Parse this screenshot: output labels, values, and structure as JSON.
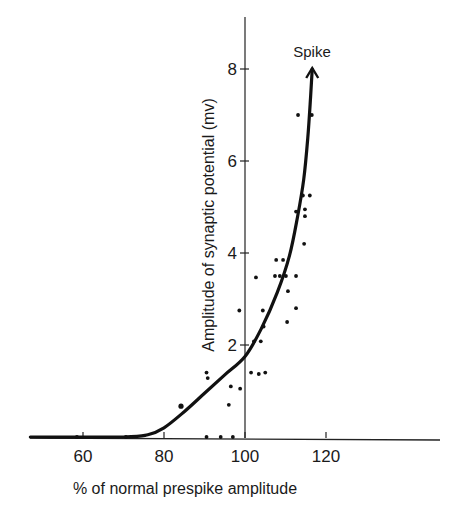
{
  "chart_data": {
    "type": "scatter",
    "title": "",
    "xlabel": "% of normal prespike amplitude",
    "ylabel": "Amplitude of synaptic potential (mv)",
    "xlim": [
      47,
      148
    ],
    "ylim": [
      0,
      9.2
    ],
    "x_ticks": [
      60,
      80,
      100,
      120
    ],
    "y_ticks": [
      2,
      4,
      6,
      8
    ],
    "y_axis_position_x": 100,
    "grid": false,
    "legend": null,
    "annotations": [
      {
        "text": "Spike",
        "x": 116.5,
        "y": 8.6,
        "note": "arrowhead at end of fitted curve"
      }
    ],
    "series": [
      {
        "name": "measurements",
        "kind": "scatter",
        "points": [
          [
            58.5,
            0.0
          ],
          [
            70.6,
            0.0
          ],
          [
            84.2,
            0.67
          ],
          [
            90.5,
            1.4
          ],
          [
            90.8,
            1.28
          ],
          [
            90.5,
            0.0
          ],
          [
            94.0,
            0.0
          ],
          [
            97.0,
            0.0
          ],
          [
            96.0,
            0.7
          ],
          [
            96.5,
            1.1
          ],
          [
            98.8,
            1.05
          ],
          [
            98.6,
            2.75
          ],
          [
            101.5,
            1.4
          ],
          [
            103.4,
            1.37
          ],
          [
            105.0,
            1.4
          ],
          [
            102.7,
            3.47
          ],
          [
            102.2,
            2.08
          ],
          [
            103.9,
            2.08
          ],
          [
            104.4,
            2.75
          ],
          [
            104.6,
            2.4
          ],
          [
            107.7,
            3.85
          ],
          [
            109.4,
            3.85
          ],
          [
            107.4,
            3.5
          ],
          [
            108.6,
            3.5
          ],
          [
            110.1,
            3.5
          ],
          [
            112.6,
            3.5
          ],
          [
            110.6,
            3.17
          ],
          [
            112.6,
            2.8
          ],
          [
            110.4,
            2.5
          ],
          [
            114.6,
            4.2
          ],
          [
            112.6,
            4.9
          ],
          [
            114.8,
            4.95
          ],
          [
            114.8,
            4.8
          ],
          [
            114.3,
            5.25
          ],
          [
            116.0,
            5.25
          ],
          [
            113.1,
            7.0
          ],
          [
            116.5,
            7.0
          ]
        ]
      },
      {
        "name": "fitted curve",
        "kind": "line",
        "points": [
          [
            47,
            0.0
          ],
          [
            70,
            0.0
          ],
          [
            76,
            0.05
          ],
          [
            80,
            0.2
          ],
          [
            85,
            0.55
          ],
          [
            90,
            0.95
          ],
          [
            95,
            1.35
          ],
          [
            100,
            1.75
          ],
          [
            104,
            2.35
          ],
          [
            108,
            3.15
          ],
          [
            111,
            3.95
          ],
          [
            113,
            4.8
          ],
          [
            114.5,
            5.6
          ],
          [
            115.5,
            6.5
          ],
          [
            116.2,
            7.4
          ],
          [
            116.6,
            8.0
          ]
        ]
      }
    ]
  }
}
